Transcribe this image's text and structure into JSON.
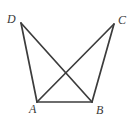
{
  "figure": {
    "canvas": {
      "width": 137,
      "height": 120
    },
    "background_color": "#ffffff",
    "line_color": "#3c3c3c",
    "label_color": "#3a3a3a",
    "vertices": [
      {
        "id": "D",
        "label": "D",
        "x": 21,
        "y": 23,
        "label_x": 7,
        "label_y": 13
      },
      {
        "id": "C",
        "label": "C",
        "x": 114,
        "y": 24,
        "label_x": 118,
        "label_y": 14
      },
      {
        "id": "A",
        "label": "A",
        "x": 37,
        "y": 102,
        "label_x": 29,
        "label_y": 103
      },
      {
        "id": "B",
        "label": "B",
        "x": 92,
        "y": 102,
        "label_x": 96,
        "label_y": 104
      }
    ],
    "segments": [
      {
        "id": "DA",
        "from": "D",
        "to": "A",
        "x1": 21,
        "y1": 23,
        "x2": 37,
        "y2": 102
      },
      {
        "id": "DB",
        "from": "D",
        "to": "B",
        "x1": 21,
        "y1": 23,
        "x2": 92,
        "y2": 102
      },
      {
        "id": "CB",
        "from": "C",
        "to": "B",
        "x1": 114,
        "y1": 24,
        "x2": 92,
        "y2": 102
      },
      {
        "id": "CA",
        "from": "C",
        "to": "A",
        "x1": 114,
        "y1": 24,
        "x2": 37,
        "y2": 102
      },
      {
        "id": "AB",
        "from": "A",
        "to": "B",
        "x1": 37,
        "y1": 102,
        "x2": 92,
        "y2": 102
      }
    ],
    "intersections": [
      {
        "id": "DB-CA",
        "of": [
          "DB",
          "CA"
        ],
        "x": 67,
        "y": 80
      }
    ]
  }
}
